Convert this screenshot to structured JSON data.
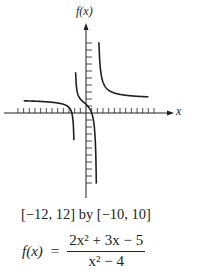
{
  "chart_data": {
    "type": "line",
    "title": "",
    "function": "f(x) = (2x^2 + 3x - 5)/(x^2 - 4)",
    "xlabel": "x",
    "ylabel": "f(x)",
    "xlim": [
      -12,
      12
    ],
    "ylim": [
      -10,
      10
    ],
    "x_tick_step": 1,
    "y_tick_step": 1,
    "grid": false,
    "legend": null,
    "vertical_asymptotes": [
      -2,
      2
    ],
    "horizontal_asymptote": 2,
    "series": [
      {
        "name": "left branch",
        "x": [
          -11,
          -8,
          -6,
          -4,
          -3,
          -2.6,
          -2.3,
          -2.15
        ],
        "y": [
          2.29,
          2.43,
          2.59,
          3.25,
          4.0,
          5.4,
          8.7,
          10
        ]
      },
      {
        "name": "middle branch",
        "x": [
          -1.85,
          -1.7,
          -1.5,
          -1,
          0,
          0.5,
          1,
          1.5,
          1.8,
          1.9
        ],
        "y": [
          10,
          3.91,
          1.43,
          0,
          1.25,
          1.67,
          0,
          -2.29,
          -6.0,
          -10
        ]
      },
      {
        "name": "right branch",
        "x": [
          2.1,
          2.3,
          2.6,
          3,
          4,
          6,
          8,
          11
        ],
        "y": [
          10,
          7.7,
          5.3,
          4.6,
          3.25,
          2.59,
          2.43,
          2.29
        ]
      }
    ]
  },
  "labels": {
    "y_axis": "f(x)",
    "x_axis": "x",
    "window": "[−12, 12] by [−10, 10]",
    "formula_lhs": "f(x)",
    "formula_eq": "=",
    "numerator": "2x² + 3x − 5",
    "denominator": "x² − 4"
  }
}
